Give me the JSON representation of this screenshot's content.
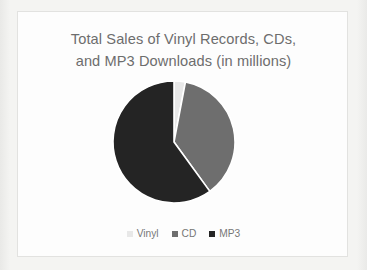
{
  "chart_data": {
    "type": "pie",
    "title": "Total Sales of Vinyl Records, CDs, and MP3 Downloads (in millions)",
    "title_line1": "Total Sales of Vinyl Records, CDs,",
    "title_line2": "and MP3 Downloads (in millions)",
    "xlabel": "",
    "ylabel": "",
    "legend_position": "bottom",
    "grid": false,
    "units": "millions",
    "categories": [
      "Vinyl",
      "CD",
      "MP3"
    ],
    "values": [
      3,
      37,
      60
    ],
    "start_angle_deg": 0,
    "direction": "clockwise",
    "slices": [
      {
        "label": "Vinyl",
        "value": 3,
        "percent": 3,
        "angle_deg": 10.8,
        "color": "#e8e8e8"
      },
      {
        "label": "CD",
        "value": 37,
        "percent": 37,
        "angle_deg": 133.2,
        "color": "#6e6e6e"
      },
      {
        "label": "MP3",
        "value": 60,
        "percent": 60,
        "angle_deg": 216.0,
        "color": "#242424"
      }
    ]
  },
  "legend": {
    "items": [
      {
        "label": "Vinyl",
        "color": "#e8e8e8"
      },
      {
        "label": "CD",
        "color": "#6e6e6e"
      },
      {
        "label": "MP3",
        "color": "#242424"
      }
    ]
  },
  "colors": {
    "page_background": "#f3f3f1",
    "card_background": "#fdfdfd",
    "card_border": "#e2e2e0",
    "title_text": "#6d6d6d",
    "legend_text": "#777777",
    "slice_separator": "#ffffff"
  }
}
